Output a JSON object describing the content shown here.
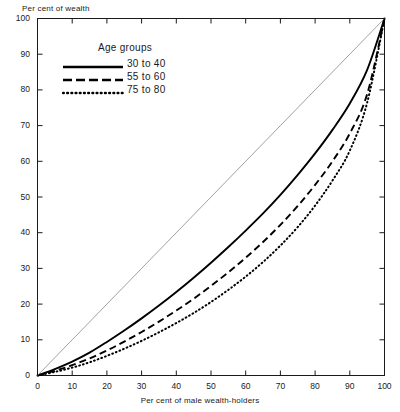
{
  "chart_data": {
    "type": "line",
    "title": "",
    "xlabel": "Per cent of male wealth-holders",
    "ylabel": "Per cent of wealth",
    "xlim": [
      0,
      100
    ],
    "ylim": [
      0,
      100
    ],
    "grid": false,
    "legend_position": "top-left",
    "legend_title": "Age groups",
    "xticks": [
      0,
      10,
      20,
      30,
      40,
      50,
      60,
      70,
      80,
      90,
      100
    ],
    "yticks": [
      0,
      10,
      20,
      30,
      40,
      50,
      60,
      70,
      80,
      90,
      100
    ],
    "xtick_labels": [
      "0",
      "10",
      "20",
      "30",
      "40",
      "50",
      "60",
      "70",
      "80",
      "90",
      "100"
    ],
    "ytick_labels": [
      "0",
      "10",
      "20",
      "30",
      "40",
      "50",
      "60",
      "70",
      "80",
      "90",
      "100"
    ],
    "x": [
      0,
      5,
      10,
      15,
      20,
      25,
      30,
      35,
      40,
      45,
      50,
      55,
      60,
      65,
      70,
      75,
      80,
      85,
      90,
      95,
      100
    ],
    "series": [
      {
        "name": "30 to 40",
        "style": "solid",
        "color": "#000000",
        "values": [
          0,
          1.8,
          3.9,
          6.4,
          9.4,
          12.6,
          16.0,
          19.6,
          23.4,
          27.4,
          31.6,
          36.0,
          40.6,
          45.4,
          50.6,
          56.2,
          62.2,
          68.8,
          76.2,
          85.6,
          100
        ]
      },
      {
        "name": "55 to 60",
        "style": "dashed",
        "color": "#000000",
        "values": [
          0,
          1.3,
          2.9,
          4.8,
          7.0,
          9.5,
          12.2,
          15.1,
          18.2,
          21.5,
          25.1,
          28.9,
          33.0,
          37.4,
          42.2,
          47.5,
          53.4,
          60.0,
          67.8,
          78.8,
          100
        ]
      },
      {
        "name": "75 to 80",
        "style": "dotted",
        "color": "#000000",
        "values": [
          0,
          1.0,
          2.2,
          3.7,
          5.5,
          7.5,
          9.7,
          12.1,
          14.7,
          17.5,
          20.6,
          24.0,
          27.7,
          31.8,
          36.4,
          41.6,
          47.6,
          54.6,
          63.0,
          76.4,
          100
        ]
      },
      {
        "name": "line-of-equality",
        "style": "thin-solid",
        "color": "#777777",
        "values": [
          0,
          5,
          10,
          15,
          20,
          25,
          30,
          35,
          40,
          45,
          50,
          55,
          60,
          65,
          70,
          75,
          80,
          85,
          90,
          95,
          100
        ]
      }
    ],
    "legend_entries": [
      "30 to 40",
      "55 to 60",
      "75 to 80"
    ]
  }
}
